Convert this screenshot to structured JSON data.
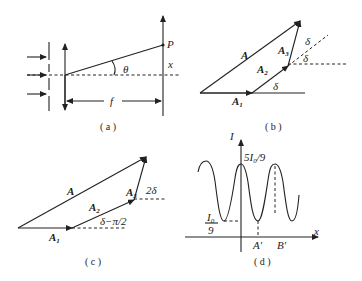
{
  "figure": {
    "panels": [
      {
        "id": "a",
        "caption": "( a )",
        "labels": {
          "point": "P",
          "angle": "θ",
          "distance": "x",
          "focal": "f"
        },
        "description": "Plane wave incident on a multi-slit screen, lens of focal length f focusing rays at angle θ to point P on the focal-plane screen at height x"
      },
      {
        "id": "b",
        "caption": "( b )",
        "labels": {
          "resultant": "A",
          "a1": "A",
          "a1_sub": "1",
          "a2": "A",
          "a2_sub": "2",
          "a3": "A",
          "a3_sub": "3",
          "delta1": "δ",
          "delta2": "δ",
          "delta3": "δ"
        },
        "description": "Phasor diagram: A1, A2, A3 each successively rotated by δ, summing to resultant A"
      },
      {
        "id": "c",
        "caption": "( c )",
        "labels": {
          "resultant": "A",
          "a1": "A",
          "a1_sub": "1",
          "a2": "A",
          "a2_sub": "2",
          "a3": "A",
          "a3_sub": "3",
          "angle2": "δ−π/2",
          "angle3": "2δ"
        },
        "description": "Phasor diagram with A2 rotated by δ−π/2 and A3 rotated by 2δ"
      },
      {
        "id": "d",
        "caption": "( d )",
        "labels": {
          "y_axis": "I",
          "x_axis": "x",
          "max_value": "5I",
          "max_sub": "0",
          "max_tail": "/9",
          "min_num": "I",
          "min_num_sub": "0",
          "min_den": "9",
          "point_a": "A′",
          "point_b": "B′"
        },
        "description": "Intensity distribution oscillating between I0/9 and 5I0/9"
      }
    ]
  }
}
